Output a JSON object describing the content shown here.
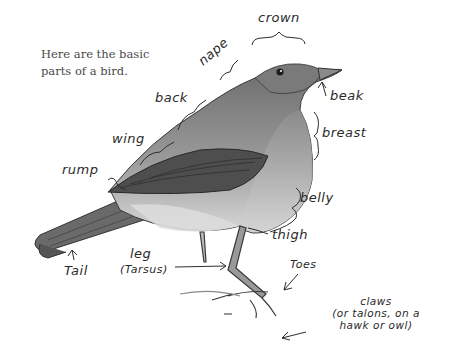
{
  "intro_text": "Here are the basic parts of a bird.",
  "labels": {
    "crown": "crown",
    "nape": "nape",
    "back": "back",
    "wing": "wing",
    "rump": "rump",
    "beak": "beak",
    "breast": "breast",
    "belly": "belly",
    "thigh": "thigh",
    "toes": "Toes",
    "leg": "leg",
    "tarsus": "(Tarsus)",
    "tail": "Tail",
    "claws_line1": "claws",
    "claws_line2": "(or talons, on a",
    "claws_line3": "hawk or owl)"
  },
  "colors": {
    "ink": "#2a2a2a",
    "body_dark": "#6b6b6b",
    "body_light": "#c9c9c9",
    "background": "#ffffff"
  }
}
